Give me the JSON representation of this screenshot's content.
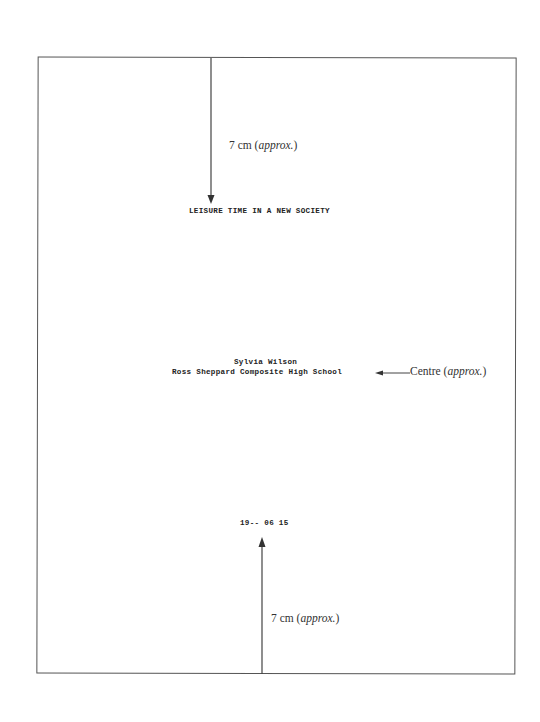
{
  "document": {
    "title": "LEISURE TIME IN A NEW SOCIETY",
    "author": "Sylvia Wilson",
    "school": "Ross Sheppard Composite High School",
    "date": "19-- 06 15"
  },
  "annotations": {
    "top_distance": {
      "value": "7 cm",
      "qualifier": "approx.",
      "open": "(",
      "close": ")"
    },
    "centre": {
      "label": "Centre",
      "qualifier": "approx.",
      "open": "(",
      "close": ")"
    },
    "bottom_distance": {
      "value": "7 cm",
      "qualifier": "approx.",
      "open": "(",
      "close": ")"
    }
  },
  "colors": {
    "border": "#555555",
    "text": "#222222",
    "arrow": "#444444"
  }
}
